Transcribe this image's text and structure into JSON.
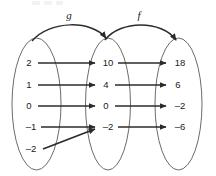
{
  "diagram": {
    "type": "function-composition-mapping",
    "function_labels": [
      {
        "name": "g",
        "label": "g",
        "from_set": "domain",
        "to_set": "middle"
      },
      {
        "name": "f",
        "label": "f",
        "from_set": "middle",
        "to_set": "range"
      }
    ],
    "sets": {
      "domain": {
        "name": "domain-oval",
        "values": [
          "2",
          "1",
          "0",
          "–1",
          "–2"
        ]
      },
      "middle": {
        "name": "middle-oval",
        "values": [
          "10",
          "4",
          "0",
          "–2"
        ]
      },
      "range": {
        "name": "range-oval",
        "values": [
          "18",
          "6",
          "–2",
          "–6"
        ]
      }
    },
    "mappings_g": [
      {
        "from": "2",
        "to": "10"
      },
      {
        "from": "1",
        "to": "4"
      },
      {
        "from": "0",
        "to": "0"
      },
      {
        "from": "–1",
        "to": "–2"
      },
      {
        "from": "–2",
        "to": "–2"
      }
    ],
    "mappings_f": [
      {
        "from": "10",
        "to": "18"
      },
      {
        "from": "4",
        "to": "6"
      },
      {
        "from": "0",
        "to": "–2"
      },
      {
        "from": "–2",
        "to": "–6"
      }
    ],
    "colors": {
      "oval_stroke": "#6b6b6b",
      "arrow_stroke": "#2b2b2b",
      "text": "#1a1a1a",
      "background": "#ffffff"
    }
  }
}
